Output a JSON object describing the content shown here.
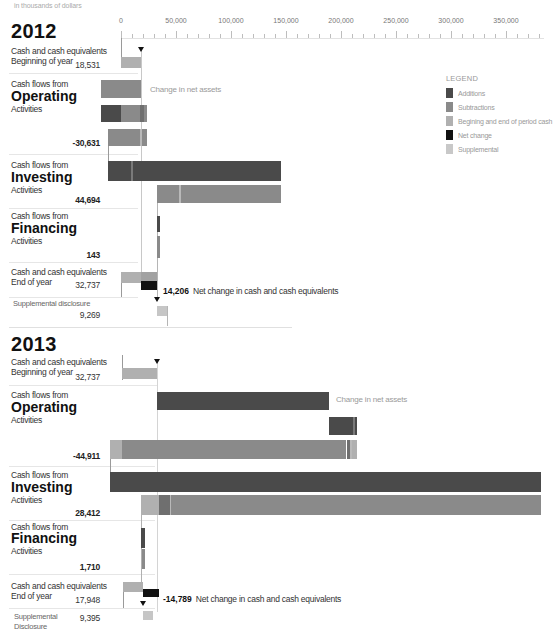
{
  "header": {
    "units_note": "in thousands of dollars"
  },
  "axis": {
    "ticks": [
      {
        "label": "0",
        "value": 0
      },
      {
        "label": "50,000",
        "value": 50000
      },
      {
        "label": "100,000",
        "value": 100000
      },
      {
        "label": "150,000",
        "value": 150000
      },
      {
        "label": "200,000",
        "value": 200000
      },
      {
        "label": "250,000",
        "value": 250000
      },
      {
        "label": "300,000",
        "value": 300000
      },
      {
        "label": "350,000",
        "value": 350000
      }
    ]
  },
  "legend": {
    "title": "LEGEND",
    "items": [
      {
        "label": "Additions",
        "color": "#4a4a4a"
      },
      {
        "label": "Subtractions",
        "color": "#8a8a8a"
      },
      {
        "label": "Begining and end of period cash",
        "color": "#b0b0b0"
      },
      {
        "label": "Net change",
        "color": "#111111"
      },
      {
        "label": "Supplemental",
        "color": "#c8c8c8"
      }
    ]
  },
  "years": [
    {
      "year": "2012",
      "begin": {
        "line1": "Cash and cash equivalents",
        "line2": "Beginning of year",
        "value": "18,531"
      },
      "operating": {
        "pre": "Cash flows from",
        "name": "Operating",
        "post": "Activities",
        "value": "-30,631",
        "annotation": "Change in net assets"
      },
      "investing": {
        "pre": "Cash flows from",
        "name": "Investing",
        "post": "Activities",
        "value": "44,694"
      },
      "financing": {
        "pre": "Cash flows from",
        "name": "Financing",
        "post": "Activities",
        "value": "143"
      },
      "end": {
        "line1": "Cash and cash equivalents",
        "line2": "End of year",
        "value": "32,737",
        "net_change_value": "14,206",
        "net_change_label": "Net change in cash and cash equivalents"
      },
      "supplemental": {
        "label": "Supplemental disclosure",
        "value": "9,269"
      }
    },
    {
      "year": "2013",
      "begin": {
        "line1": "Cash and cash equivalents",
        "line2": "Beginning of year",
        "value": "32,737"
      },
      "operating": {
        "pre": "Cash flows from",
        "name": "Operating",
        "post": "Activities",
        "value": "-44,911",
        "annotation": "Change in net assets"
      },
      "investing": {
        "pre": "Cash flows from",
        "name": "Investing",
        "post": "Activities",
        "value": "28,412"
      },
      "financing": {
        "pre": "Cash flows from",
        "name": "Financing",
        "post": "Activities",
        "value": "1,710"
      },
      "end": {
        "line1": "Cash and cash equivalents",
        "line2": "End of year",
        "value": "17,948",
        "net_change_value": "-14,789",
        "net_change_label": "Net change in cash and cash equivalents"
      },
      "supplemental": {
        "label": "Supplemental",
        "label2": "Disclosure",
        "value": "9,395"
      }
    }
  ],
  "chart_data": {
    "type": "bar",
    "subtype": "waterfall (horizontal)",
    "xlabel": "in thousands of dollars",
    "xlim": [
      -20000,
      385000
    ],
    "x_ticks": [
      "0",
      "50,000",
      "100,000",
      "150,000",
      "200,000",
      "250,000",
      "300,000",
      "350,000"
    ],
    "grid": false,
    "legend_position": "right",
    "legend": [
      "Additions",
      "Subtractions",
      "Begining and end of period cash",
      "Net change",
      "Supplemental"
    ],
    "categories": [
      "Beginning of year cash",
      "Operating activities",
      "Investing activities",
      "Financing activities",
      "End of year cash",
      "Net change",
      "Supplemental disclosure"
    ],
    "series": [
      {
        "name": "2012",
        "values": [
          18531,
          -30631,
          44694,
          143,
          32737,
          14206,
          9269
        ]
      },
      {
        "name": "2013",
        "values": [
          32737,
          -44911,
          28412,
          1710,
          17948,
          -14789,
          9395
        ]
      }
    ],
    "render": {
      "origin_px": 121,
      "px_per_thousand": 1.1,
      "colors": {
        "add": "#4a4a4a",
        "sub": "#8a8a8a",
        "sub2": "#6f6f6f",
        "begin": "#b0b0b0",
        "begin2": "#a2a2a2",
        "net": "#111111",
        "supp": "#c6c6c6",
        "stripe": "#b9b9b9",
        "stripe_dark": "#7a7a7a"
      },
      "bars": [
        {
          "x0": 0,
          "x1": 18.531,
          "y": 57,
          "h": 11,
          "c": "begin"
        },
        {
          "x0": -18.2,
          "x1": 18.531,
          "y": 80,
          "h": 18,
          "c": "sub"
        },
        {
          "x0": -18.2,
          "x1": 0,
          "y": 105,
          "h": 17,
          "c": "add"
        },
        {
          "x0": 0,
          "x1": 17.3,
          "y": 105,
          "h": 17,
          "c": "sub"
        },
        {
          "x0": 17.3,
          "x1": 20.5,
          "y": 105,
          "h": 17,
          "c": "sub2"
        },
        {
          "x0": 20.5,
          "x1": 23.6,
          "y": 105,
          "h": 17,
          "c": "sub"
        },
        {
          "x0": -11.8,
          "x1": 23.6,
          "y": 129,
          "h": 17,
          "c": "sub"
        },
        {
          "x0": 17.6,
          "x1": 19.4,
          "y": 129,
          "h": 17,
          "c": "stripe"
        },
        {
          "x0": -11.8,
          "x1": 145.5,
          "y": 161,
          "h": 20,
          "c": "add"
        },
        {
          "x0": 9.5,
          "x1": 10.6,
          "y": 161,
          "h": 20,
          "c": "stripe_dark"
        },
        {
          "x0": 32.737,
          "x1": 145.5,
          "y": 185,
          "h": 18,
          "c": "sub"
        },
        {
          "x0": 53,
          "x1": 54.2,
          "y": 185,
          "h": 18,
          "c": "stripe"
        },
        {
          "x0": 32.3,
          "x1": 35.2,
          "y": 216,
          "h": 16,
          "c": "add"
        },
        {
          "x0": 32.9,
          "x1": 35.2,
          "y": 236,
          "h": 22,
          "c": "sub"
        },
        {
          "x0": 0,
          "x1": 18.531,
          "y": 272,
          "h": 11,
          "c": "begin"
        },
        {
          "x0": 18.531,
          "x1": 32.737,
          "y": 272,
          "h": 9,
          "c": "begin2"
        },
        {
          "x0": 18.531,
          "x1": 32.737,
          "y": 281,
          "h": 9,
          "c": "net"
        },
        {
          "x0": 32.737,
          "x1": 41.8,
          "y": 306,
          "h": 10,
          "c": "supp"
        },
        {
          "x0": 0.5,
          "x1": 32.737,
          "y": 368,
          "h": 11,
          "c": "begin"
        },
        {
          "x0": 32.737,
          "x1": 189,
          "y": 392,
          "h": 18,
          "c": "add"
        },
        {
          "x0": 189,
          "x1": 211,
          "y": 417,
          "h": 18,
          "c": "add"
        },
        {
          "x0": 211,
          "x1": 212.5,
          "y": 417,
          "h": 18,
          "c": "stripe_dark"
        },
        {
          "x0": 212.5,
          "x1": 214.5,
          "y": 417,
          "h": 18,
          "c": "add"
        },
        {
          "x0": -10,
          "x1": 1,
          "y": 440,
          "h": 19,
          "c": "begin"
        },
        {
          "x0": 1,
          "x1": 205,
          "y": 440,
          "h": 19,
          "c": "sub"
        },
        {
          "x0": 205,
          "x1": 208,
          "y": 440,
          "h": 19,
          "c": "sub2"
        },
        {
          "x0": 208,
          "x1": 210,
          "y": 440,
          "h": 19,
          "c": "stripe"
        },
        {
          "x0": 210,
          "x1": 214.5,
          "y": 440,
          "h": 19,
          "c": "begin"
        },
        {
          "x0": -10,
          "x1": 381.8,
          "y": 472,
          "h": 20,
          "c": "add"
        },
        {
          "x0": 17.948,
          "x1": 34.5,
          "y": 495,
          "h": 20,
          "c": "begin"
        },
        {
          "x0": 34.5,
          "x1": 44.5,
          "y": 495,
          "h": 20,
          "c": "sub2"
        },
        {
          "x0": 44.5,
          "x1": 45.5,
          "y": 495,
          "h": 20,
          "c": "stripe"
        },
        {
          "x0": 45.5,
          "x1": 381.8,
          "y": 495,
          "h": 20,
          "c": "sub"
        },
        {
          "x0": 18.3,
          "x1": 21.5,
          "y": 528,
          "h": 20,
          "c": "add"
        },
        {
          "x0": 19.2,
          "x1": 21.5,
          "y": 549,
          "h": 20,
          "c": "sub"
        },
        {
          "x0": 1.8,
          "x1": 19.7,
          "y": 582,
          "h": 10,
          "c": "begin"
        },
        {
          "x0": 19.7,
          "x1": 34.3,
          "y": 589,
          "h": 8,
          "c": "net"
        },
        {
          "x0": 19.7,
          "x1": 29,
          "y": 611,
          "h": 9,
          "c": "supp"
        }
      ],
      "vlines": [
        {
          "x": 0,
          "y1": 38,
          "y2": 68,
          "color": "#9a9a9a"
        },
        {
          "x": 18.531,
          "y1": 50,
          "y2": 272,
          "color": "#c8c8c8"
        },
        {
          "x": -11.8,
          "y1": 129,
          "y2": 161,
          "color": "#9a9a9a"
        },
        {
          "x": 32.737,
          "y1": 185,
          "y2": 300,
          "color": "#b5b5b5"
        },
        {
          "x": 0,
          "y1": 272,
          "y2": 297,
          "color": "#9a9a9a"
        },
        {
          "x": 41.8,
          "y1": 306,
          "y2": 326,
          "color": "#b5b5b5"
        },
        {
          "x": 0.5,
          "y1": 355,
          "y2": 380,
          "color": "#9a9a9a"
        },
        {
          "x": 32.737,
          "y1": 362,
          "y2": 612,
          "color": "#d4d4d4"
        },
        {
          "x": -10,
          "y1": 440,
          "y2": 492,
          "color": "#9a9a9a"
        },
        {
          "x": 17.948,
          "y1": 495,
          "y2": 582,
          "color": "#b0b0b0"
        },
        {
          "x": 1.8,
          "y1": 582,
          "y2": 608,
          "color": "#9a9a9a"
        }
      ],
      "triangles": [
        {
          "x": 18.531,
          "y": 47
        },
        {
          "x": 32.737,
          "y": 297
        },
        {
          "x": 32.737,
          "y": 359
        },
        {
          "x": 19.7,
          "y": 601
        }
      ]
    }
  }
}
